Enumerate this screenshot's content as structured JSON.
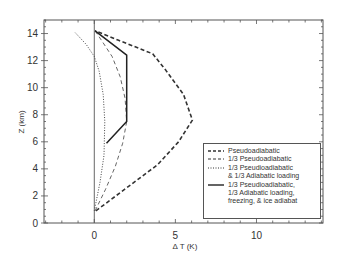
{
  "chart_data": {
    "type": "line",
    "title": "",
    "xlabel": "ΔT (K)",
    "ylabel": "Z (km)",
    "xlim": [
      -3.1,
      14.1
    ],
    "ylim": [
      0,
      15.0
    ],
    "x_ticks": [
      0,
      5,
      10
    ],
    "x_tick_labels": [
      "0",
      "5",
      "10"
    ],
    "y_ticks": [
      0,
      2,
      4,
      6,
      8,
      10,
      12,
      14
    ],
    "y_tick_labels": [
      "0",
      "2",
      "4",
      "6",
      "8",
      "10",
      "12",
      "14"
    ],
    "grid": false,
    "legend_position": "lower right",
    "reference_line": {
      "x": 0
    },
    "series": [
      {
        "name": "Pseudoadiabatic",
        "style": "bold-dashed",
        "points": [
          [
            0.1,
            0.9
          ],
          [
            2.0,
            2.6
          ],
          [
            3.9,
            4.3
          ],
          [
            5.2,
            6.0
          ],
          [
            6.05,
            7.6
          ],
          [
            5.5,
            9.5
          ],
          [
            4.4,
            11.3
          ],
          [
            3.6,
            12.5
          ],
          [
            1.5,
            13.5
          ],
          [
            0.05,
            14.2
          ]
        ]
      },
      {
        "name": "1/3 Pseudoadiabatic",
        "style": "thin-dashed",
        "points": [
          [
            0.05,
            0.9
          ],
          [
            0.7,
            2.5
          ],
          [
            1.3,
            4.2
          ],
          [
            1.75,
            5.9
          ],
          [
            2.0,
            7.5
          ],
          [
            1.9,
            9.2
          ],
          [
            1.6,
            10.8
          ],
          [
            1.1,
            12.3
          ],
          [
            0.5,
            13.4
          ],
          [
            0.05,
            14.2
          ]
        ]
      },
      {
        "name": "1/3 Pseudioadiabatic & 1/3 Adiabatic loading",
        "style": "dotted",
        "points": [
          [
            0.0,
            0.9
          ],
          [
            0.35,
            3.0
          ],
          [
            0.6,
            5.0
          ],
          [
            0.65,
            7.5
          ],
          [
            0.55,
            9.5
          ],
          [
            0.3,
            11.2
          ],
          [
            0.0,
            12.3
          ],
          [
            -0.5,
            13.2
          ],
          [
            -1.2,
            14.1
          ]
        ]
      },
      {
        "name": "1/3 Pseudioadiabatic, 1/3 Adiabatic loading, freezing, & ice adiabat",
        "style": "solid",
        "points": [
          [
            0.75,
            5.9
          ],
          [
            2.0,
            7.5
          ],
          [
            2.0,
            12.4
          ],
          [
            0.05,
            14.2
          ]
        ]
      }
    ]
  },
  "legend": {
    "items": [
      {
        "label": "Pseudoadiabatic",
        "style": "bold-dashed"
      },
      {
        "label": "1/3 Pseudoadiabatic",
        "style": "thin-dashed"
      },
      {
        "label": "1/3 Pseudioadiabatic\n& 1/3 Adiabatic  loading",
        "style": "dotted"
      },
      {
        "label": "1/3 Pseudioadiabatic,\n1/3 Adiabatic  loading,\n freezing, & ice  adiabat",
        "style": "solid"
      }
    ]
  },
  "axes": {
    "x_label": "Δ T (K)",
    "y_label": "Z (km)"
  }
}
